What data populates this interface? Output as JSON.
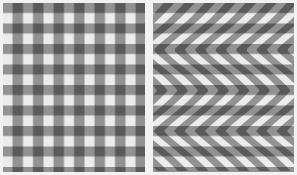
{
  "figure": {
    "panels": [
      {
        "id": "left",
        "label": "Gingham check pattern",
        "type": "orthogonal-grid",
        "stripe_period_px": 20.5,
        "stripe_width_px": 10
      },
      {
        "id": "right",
        "label": "Curved stripe illusion",
        "type": "curved-grid",
        "stripe_period_px": 20.5,
        "stripe_width_px": 10
      }
    ],
    "colors": {
      "background": "#f2f2f2",
      "light_cell": "#ececec",
      "mid_gray": "#9a9a9a",
      "dark_cell": "#444444"
    }
  }
}
